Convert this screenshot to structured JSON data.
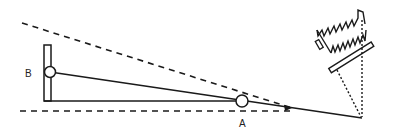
{
  "diagram": {
    "type": "optical-alignment-schematic",
    "labels": {
      "point_b": "B",
      "point_a": "A"
    },
    "colors": {
      "stroke": "#1a1a1a",
      "background": "#ffffff"
    },
    "elements": [
      {
        "name": "upper-dashed-sightline",
        "style": "dashed"
      },
      {
        "name": "lower-dashed-baseline",
        "style": "dashed"
      },
      {
        "name": "vertical-post",
        "style": "solid"
      },
      {
        "name": "pivot-b",
        "shape": "circle"
      },
      {
        "name": "pivot-a",
        "shape": "circle"
      },
      {
        "name": "beam-line",
        "style": "solid"
      },
      {
        "name": "base-line",
        "style": "solid"
      },
      {
        "name": "arrowhead",
        "shape": "arrow"
      },
      {
        "name": "device-housing",
        "shape": "zigzag-box"
      },
      {
        "name": "device-plate",
        "shape": "rectangle"
      },
      {
        "name": "projection-lines",
        "style": "dotted"
      }
    ]
  }
}
